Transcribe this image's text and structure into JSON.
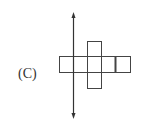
{
  "option": {
    "label": "(C)"
  },
  "figure": {
    "stroke_color": "#444444",
    "axis": {
      "type": "double-arrow",
      "orientation": "vertical"
    },
    "horizontal_strip_squares": 5,
    "vertical_rectangle": {
      "spans_rows": 3,
      "column": 3
    }
  }
}
